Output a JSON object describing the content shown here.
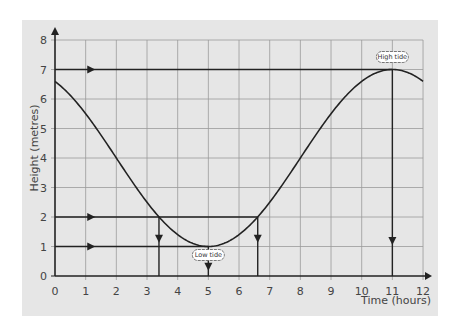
{
  "chart_data": {
    "type": "line",
    "title": "",
    "xlabel": "Time (hours)",
    "ylabel": "Height (metres)",
    "xlim": [
      0,
      12
    ],
    "ylim": [
      0,
      8
    ],
    "x_ticks": [
      0,
      1,
      2,
      3,
      4,
      5,
      6,
      7,
      8,
      9,
      10,
      11,
      12
    ],
    "y_ticks": [
      0,
      1,
      2,
      3,
      4,
      5,
      6,
      7,
      8
    ],
    "grid": true,
    "legend": null,
    "series": [
      {
        "name": "Tide height",
        "formula": "h = 4 - 3cos(2π(t-5)/12)",
        "x": [
          0,
          1,
          2,
          3,
          3.39,
          4,
          5,
          6,
          6.61,
          7,
          8,
          9,
          10,
          11,
          12
        ],
        "y": [
          6.6,
          6.3,
          5.5,
          4.5,
          2.0,
          1.4,
          1.0,
          1.4,
          2.0,
          2.5,
          4.0,
          5.5,
          6.6,
          7.0,
          6.6
        ]
      }
    ],
    "annotations": [
      {
        "label": "High tide",
        "t": 11,
        "h": 7
      },
      {
        "label": "Low tide",
        "t": 5,
        "h": 1
      }
    ],
    "reference_lines": [
      {
        "type": "horizontal",
        "h": 7,
        "from_t": 0,
        "to_t": 11
      },
      {
        "type": "vertical",
        "t": 11,
        "from_h": 7,
        "to_h": 0
      },
      {
        "type": "horizontal",
        "h": 2,
        "from_t": 0,
        "to_t": 6.61
      },
      {
        "type": "vertical",
        "t": 3.39,
        "from_h": 2,
        "to_h": 0
      },
      {
        "type": "vertical",
        "t": 6.61,
        "from_h": 2,
        "to_h": 0
      },
      {
        "type": "horizontal",
        "h": 1,
        "from_t": 0,
        "to_t": 5
      },
      {
        "type": "vertical",
        "t": 5,
        "from_h": 1,
        "to_h": 0
      }
    ]
  },
  "style": {
    "panel_bg": "#e6e6e6",
    "grid_color": "#9a9a9a",
    "line_color": "#222222"
  }
}
